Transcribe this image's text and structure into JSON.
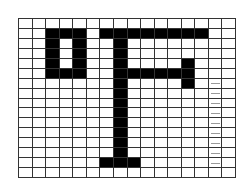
{
  "figure": {
    "glyph": "°F",
    "columns": 16,
    "rows": 16,
    "colors": {
      "filled": "#000000",
      "empty": "#ffffff",
      "grid_line": "#333333",
      "tick": "#9a9a9a"
    },
    "filled_cells": [
      [
        1,
        2
      ],
      [
        1,
        3
      ],
      [
        1,
        4
      ],
      [
        1,
        6
      ],
      [
        1,
        7
      ],
      [
        1,
        8
      ],
      [
        1,
        9
      ],
      [
        1,
        10
      ],
      [
        1,
        11
      ],
      [
        1,
        12
      ],
      [
        1,
        13
      ],
      [
        2,
        2
      ],
      [
        2,
        4
      ],
      [
        2,
        7
      ],
      [
        3,
        2
      ],
      [
        3,
        4
      ],
      [
        3,
        7
      ],
      [
        4,
        2
      ],
      [
        4,
        4
      ],
      [
        4,
        7
      ],
      [
        4,
        12
      ],
      [
        5,
        2
      ],
      [
        5,
        3
      ],
      [
        5,
        4
      ],
      [
        5,
        7
      ],
      [
        5,
        8
      ],
      [
        5,
        9
      ],
      [
        5,
        10
      ],
      [
        5,
        11
      ],
      [
        5,
        12
      ],
      [
        6,
        7
      ],
      [
        6,
        12
      ],
      [
        7,
        7
      ],
      [
        8,
        7
      ],
      [
        9,
        7
      ],
      [
        10,
        7
      ],
      [
        11,
        7
      ],
      [
        12,
        7
      ],
      [
        13,
        7
      ],
      [
        14,
        6
      ],
      [
        14,
        7
      ],
      [
        14,
        8
      ]
    ],
    "tick_cells": [
      [
        6,
        14
      ],
      [
        7,
        14
      ],
      [
        8,
        14
      ],
      [
        9,
        14
      ],
      [
        10,
        14
      ],
      [
        11,
        14
      ],
      [
        12,
        14
      ],
      [
        13,
        14
      ],
      [
        14,
        14
      ]
    ]
  }
}
